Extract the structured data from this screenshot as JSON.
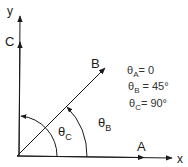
{
  "diagram": {
    "axes": {
      "x_label": "x",
      "y_label": "y"
    },
    "vectors": [
      {
        "name": "A",
        "label": "A",
        "angle_deg": 0
      },
      {
        "name": "B",
        "label": "B",
        "angle_deg": 45
      },
      {
        "name": "C",
        "label": "C",
        "angle_deg": 90
      }
    ],
    "angle_labels": {
      "theta_b": {
        "symbol": "θ",
        "sub": "B"
      },
      "theta_c": {
        "symbol": "θ",
        "sub": "C"
      }
    },
    "equations": [
      {
        "symbol": "θ",
        "sub": "A",
        "rhs": "= 0"
      },
      {
        "symbol": "θ",
        "sub": "B",
        "rhs": " = 45°"
      },
      {
        "symbol": "θ",
        "sub": "C",
        "rhs": "= 90°"
      }
    ],
    "colors": {
      "line": "#1a1a1a",
      "text": "#333333"
    }
  }
}
